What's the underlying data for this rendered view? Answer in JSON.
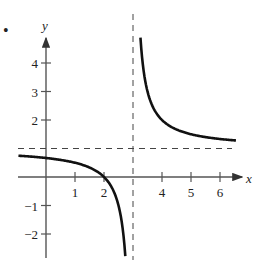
{
  "bullet": "•",
  "chart_data": {
    "type": "line",
    "title": "",
    "xlabel": "x",
    "ylabel": "y",
    "xlim": [
      -0.9,
      6.9
    ],
    "ylim": [
      -2.8,
      4.9
    ],
    "xticks": [
      1,
      2,
      4,
      5,
      6
    ],
    "xtick_labels": [
      "1",
      "2",
      "4",
      "5",
      "6"
    ],
    "yticks": [
      -2,
      -1,
      2,
      3,
      4
    ],
    "ytick_labels": [
      "−2",
      "−1",
      "2",
      "3",
      "4"
    ],
    "grid": false,
    "asymptotes": {
      "vertical": {
        "x": 3,
        "style": "dashed"
      },
      "horizontal": {
        "y": 1,
        "style": "dashed"
      }
    },
    "function": "f(x) = (x - 2)/(x - 3)",
    "series": [
      {
        "name": "left branch",
        "x": [
          -1,
          0,
          1,
          1.5,
          2,
          2.5,
          2.7,
          2.8
        ],
        "y": [
          0.75,
          0.667,
          0.5,
          0.333,
          0,
          -1,
          -2.333,
          -4
        ]
      },
      {
        "name": "right branch",
        "x": [
          3.2,
          3.25,
          3.5,
          4,
          5,
          6,
          6.5
        ],
        "y": [
          6,
          5,
          3,
          2,
          1.5,
          1.333,
          1.286
        ]
      }
    ]
  }
}
